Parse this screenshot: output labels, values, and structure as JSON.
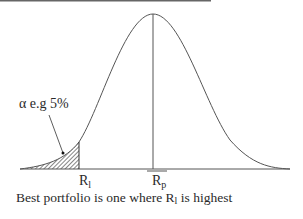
{
  "diagram": {
    "alpha_label": "α e.g 5%",
    "rl_label": "R",
    "rl_sub": "l",
    "rp_label": "R",
    "rp_sub": "p",
    "caption_pre": "Best portfolio is one where R",
    "caption_sub": "l",
    "caption_post": " is highest",
    "colors": {
      "line": "#555555",
      "text": "#2a2a2a",
      "top_rule": "#666666"
    }
  }
}
